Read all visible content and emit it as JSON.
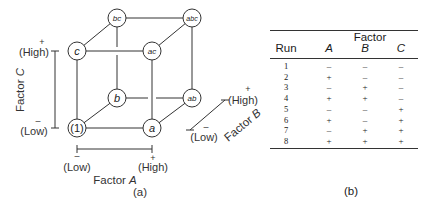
{
  "figure_a": {
    "caption": "(a)",
    "nodes": [
      {
        "id": "1",
        "label": "(1)",
        "x": 77,
        "y": 128,
        "italic": false
      },
      {
        "id": "a",
        "label": "a",
        "x": 152,
        "y": 128,
        "italic": true
      },
      {
        "id": "b",
        "label": "b",
        "x": 117,
        "y": 98,
        "italic": true
      },
      {
        "id": "ab",
        "label": "ab",
        "x": 192,
        "y": 98,
        "italic": true
      },
      {
        "id": "c",
        "label": "c",
        "x": 77,
        "y": 51,
        "italic": true
      },
      {
        "id": "ac",
        "label": "ac",
        "x": 152,
        "y": 51,
        "italic": true
      },
      {
        "id": "bc",
        "label": "bc",
        "x": 117,
        "y": 18,
        "italic": true
      },
      {
        "id": "abc",
        "label": "abc",
        "x": 192,
        "y": 18,
        "italic": true
      }
    ],
    "factor_a": {
      "label": "Factor",
      "letter": "A",
      "low_sign": "–",
      "low": "(Low)",
      "high_sign": "+",
      "high": "(High)"
    },
    "factor_b": {
      "label": "Factor",
      "letter": "B",
      "low_sign": "–",
      "low": "(Low)",
      "high_sign": "+",
      "high": "(High)"
    },
    "factor_c": {
      "label": "Factor",
      "letter": "C",
      "low_sign": "–",
      "low": "(Low)",
      "high_sign": "+",
      "high": "(High)"
    }
  },
  "figure_b": {
    "caption": "(b)",
    "group_header": "Factor",
    "columns": [
      "Run",
      "A",
      "B",
      "C"
    ],
    "rows": [
      [
        "1",
        "–",
        "–",
        "–"
      ],
      [
        "2",
        "+",
        "–",
        "–"
      ],
      [
        "3",
        "–",
        "+",
        "–"
      ],
      [
        "4",
        "+",
        "+",
        "–"
      ],
      [
        "5",
        "–",
        "–",
        "+"
      ],
      [
        "6",
        "+",
        "–",
        "+"
      ],
      [
        "7",
        "–",
        "+",
        "+"
      ],
      [
        "8",
        "+",
        "+",
        "+"
      ]
    ]
  }
}
